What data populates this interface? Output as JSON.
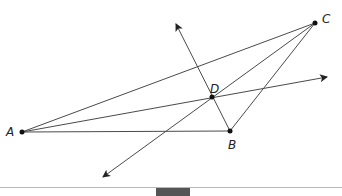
{
  "diagram": {
    "colors": {
      "line": "#4a4a4a",
      "point": "#111111",
      "label": "#222222",
      "divider": "#b8b8b8",
      "bottom_tab": "#555555"
    },
    "points": [
      {
        "id": "A",
        "label": "A",
        "x": 22,
        "y": 132
      },
      {
        "id": "B",
        "label": "B",
        "x": 230,
        "y": 131
      },
      {
        "id": "C",
        "label": "C",
        "x": 315,
        "y": 23
      },
      {
        "id": "D",
        "label": "D",
        "x": 212,
        "y": 97
      }
    ],
    "segments": [
      {
        "from": "A",
        "to": "C"
      },
      {
        "from": "A",
        "to": "B"
      },
      {
        "from": "B",
        "to": "C"
      }
    ],
    "rays": [
      {
        "name": "ray-A-through-D",
        "from": "A",
        "through": "D",
        "arrow_tip": {
          "x": 327,
          "y": 77
        }
      },
      {
        "name": "ray-C-through-D",
        "from": "C",
        "through": "D",
        "arrow_tip": {
          "x": 103,
          "y": 177
        }
      },
      {
        "name": "ray-B-through-D",
        "from": "B",
        "through": "D",
        "arrow_tip": {
          "x": 176,
          "y": 24
        }
      }
    ]
  }
}
